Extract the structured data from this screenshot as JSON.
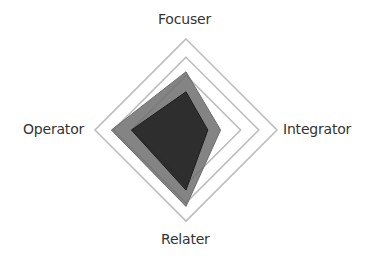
{
  "chart_data": {
    "type": "radar",
    "title": "",
    "axes": [
      "Focuser",
      "Integrator",
      "Relater",
      "Operator"
    ],
    "scale": {
      "min": 0,
      "max": 5,
      "grid_levels_visible": [
        3,
        4,
        5
      ]
    },
    "series": [
      {
        "name": "Series 1",
        "values": [
          3.2,
          1.9,
          4.2,
          4.1
        ],
        "color": "#6e6e6e",
        "opacity": 0.85
      },
      {
        "name": "Series 2",
        "values": [
          2.1,
          1.2,
          3.3,
          3.0
        ],
        "color": "#1e1e1e",
        "opacity": 0.85
      }
    ],
    "grid_color": "#bdbdbd",
    "legend": "none"
  },
  "labels": {
    "top": "Focuser",
    "right": "Integrator",
    "bottom": "Relater",
    "left": "Operator"
  }
}
